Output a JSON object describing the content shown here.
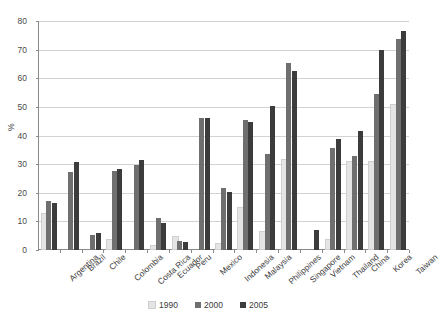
{
  "chart_data": {
    "type": "bar",
    "title": "",
    "xlabel": "",
    "ylabel": "%",
    "ylim": [
      0,
      80
    ],
    "yticks": [
      0,
      10,
      20,
      30,
      40,
      50,
      60,
      70,
      80
    ],
    "grid": true,
    "legend_position": "bottom",
    "categories": [
      "Argentina",
      "Brazil",
      "Chile",
      "Colombia",
      "Costa Rica",
      "Ecuador",
      "Peru",
      "Mexico",
      "Indonesia",
      "Malaysia",
      "Philippines",
      "Singapore",
      "Vietnam",
      "Thailand",
      "China",
      "Korea",
      "Taiwan"
    ],
    "series": [
      {
        "name": "1990",
        "color": "#e4e4e4",
        "values": [
          12.3,
          0,
          0,
          3.0,
          0,
          1.0,
          4.3,
          0,
          1.7,
          14.2,
          6.0,
          31.0,
          0,
          3.0,
          30.5,
          30.5,
          50.3
        ]
      },
      {
        "name": "2000",
        "color": "#6f6f6f",
        "values": [
          17.0,
          27.3,
          5.4,
          27.5,
          29.8,
          11.1,
          3.0,
          46.0,
          21.5,
          45.3,
          33.5,
          65.3,
          0,
          35.8,
          33.0,
          54.5,
          73.8
        ]
      },
      {
        "name": "2005",
        "color": "#3c3c3c",
        "values": [
          16.5,
          30.7,
          6.0,
          28.2,
          31.5,
          9.5,
          2.8,
          46.2,
          20.2,
          44.7,
          50.3,
          62.7,
          6.9,
          38.7,
          41.5,
          69.7,
          76.4
        ]
      }
    ]
  },
  "legend": {
    "items": [
      {
        "label": "1990",
        "series_class": "s1990"
      },
      {
        "label": "2000",
        "series_class": "s2000"
      },
      {
        "label": "2005",
        "series_class": "s2005"
      }
    ]
  }
}
